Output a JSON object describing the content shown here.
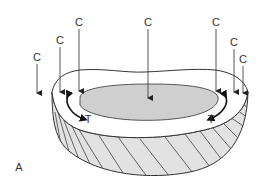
{
  "figure": {
    "panel_label": "A",
    "compression_label": "C",
    "tension_label": "T",
    "compression_arrows": [
      {
        "label": "C",
        "x": 37,
        "label_y": 61,
        "tip_y": 93
      },
      {
        "label": "C",
        "x": 60,
        "label_y": 44,
        "tip_y": 92
      },
      {
        "label": "C",
        "x": 79,
        "label_y": 26,
        "tip_y": 91
      },
      {
        "label": "C",
        "x": 148,
        "label_y": 26,
        "tip_y": 98
      },
      {
        "label": "C",
        "x": 216,
        "label_y": 26,
        "tip_y": 91
      },
      {
        "label": "C",
        "x": 234,
        "label_y": 46,
        "tip_y": 92
      },
      {
        "label": "C",
        "x": 243,
        "label_y": 63,
        "tip_y": 93
      }
    ],
    "tension_arrows": [
      {
        "label": "T",
        "side": "left"
      },
      {
        "label": "T",
        "side": "right"
      }
    ],
    "colors": {
      "line": "#333333",
      "nucleus_fill": "#cfcfcf",
      "annulus_side_fill": "#e2e2e2",
      "rim_fill": "#ffffff"
    }
  }
}
